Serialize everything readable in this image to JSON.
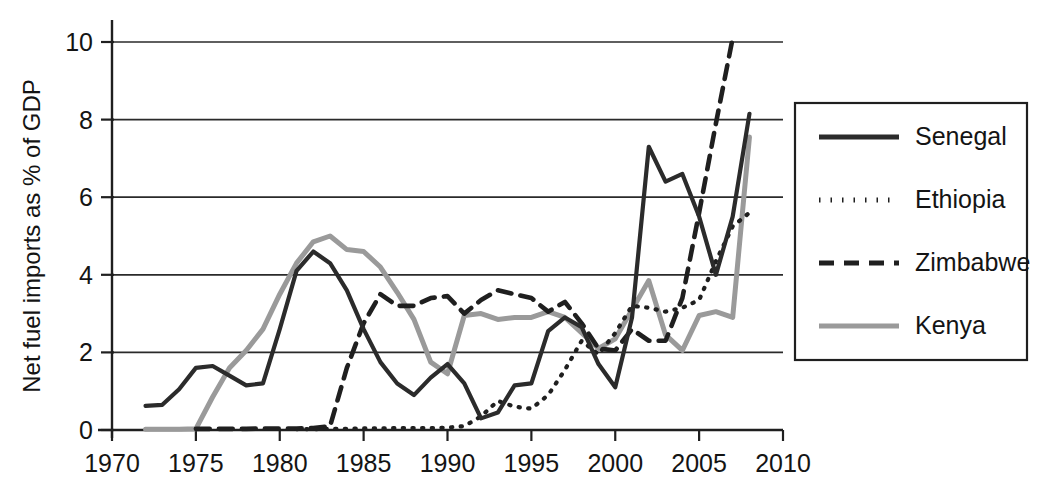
{
  "chart_data": {
    "type": "line",
    "title": "",
    "subtitle": "",
    "xlabel": "",
    "ylabel": "Net fuel imports as % of GDP",
    "xlim": [
      1970,
      2010
    ],
    "ylim": [
      0,
      10
    ],
    "grid": true,
    "grid_axis": "y",
    "legend_position": "right",
    "x_ticks": [
      "1970",
      "1975",
      "1980",
      "1985",
      "1990",
      "1995",
      "2000",
      "2005",
      "2010"
    ],
    "x_tick_values": [
      1970,
      1975,
      1980,
      1985,
      1990,
      1995,
      2000,
      2005,
      2010
    ],
    "y_ticks": [
      "0",
      "2",
      "4",
      "6",
      "8",
      "10"
    ],
    "y_tick_values": [
      0,
      2,
      4,
      6,
      8,
      10
    ],
    "series": [
      {
        "name": "Senegal",
        "style": "solid",
        "color": "#2b2b2b",
        "width": 4.2,
        "x": [
          1972,
          1973,
          1974,
          1975,
          1976,
          1977,
          1978,
          1979,
          1980,
          1981,
          1982,
          1983,
          1984,
          1985,
          1986,
          1987,
          1988,
          1989,
          1990,
          1991,
          1992,
          1993,
          1994,
          1995,
          1996,
          1997,
          1998,
          1999,
          2000,
          2001,
          2002,
          2003,
          2004,
          2005,
          2006,
          2007,
          2008
        ],
        "values": [
          0.62,
          0.65,
          1.05,
          1.6,
          1.65,
          1.4,
          1.15,
          1.2,
          2.6,
          4.1,
          4.6,
          4.3,
          3.6,
          2.6,
          1.75,
          1.2,
          0.9,
          1.35,
          1.7,
          1.2,
          0.3,
          0.45,
          1.15,
          1.2,
          2.55,
          2.9,
          2.65,
          1.7,
          1.1,
          2.9,
          7.3,
          6.4,
          6.6,
          5.5,
          4.0,
          5.5,
          8.15
        ]
      },
      {
        "name": "Ethiopia",
        "style": "dotted",
        "color": "#1f1f1f",
        "width": 4.2,
        "x": [
          1981,
          1982,
          1983,
          1984,
          1985,
          1986,
          1987,
          1988,
          1989,
          1990,
          1991,
          1992,
          1993,
          1994,
          1995,
          1996,
          1997,
          1998,
          1999,
          2000,
          2001,
          2002,
          2003,
          2004,
          2005,
          2006,
          2007,
          2008
        ],
        "values": [
          0.02,
          0.02,
          0.03,
          0.03,
          0.04,
          0.04,
          0.05,
          0.05,
          0.05,
          0.06,
          0.1,
          0.35,
          0.75,
          0.6,
          0.55,
          0.9,
          1.55,
          2.3,
          1.95,
          2.5,
          3.2,
          3.15,
          3.05,
          3.15,
          3.35,
          4.35,
          5.25,
          5.6
        ]
      },
      {
        "name": "Zimbabwe",
        "style": "dashed",
        "color": "#1f1f1f",
        "width": 4.6,
        "x": [
          1975,
          1976,
          1977,
          1978,
          1979,
          1980,
          1981,
          1982,
          1983,
          1984,
          1985,
          1986,
          1987,
          1988,
          1989,
          1990,
          1991,
          1992,
          1993,
          1994,
          1995,
          1996,
          1997,
          1998,
          1999,
          2000,
          2001,
          2002,
          2003,
          2004,
          2005,
          2006,
          2007
        ],
        "values": [
          0.03,
          0.03,
          0.03,
          0.03,
          0.04,
          0.04,
          0.04,
          0.05,
          0.1,
          1.6,
          2.75,
          3.5,
          3.2,
          3.2,
          3.4,
          3.45,
          3.0,
          3.35,
          3.6,
          3.5,
          3.4,
          3.05,
          3.3,
          2.75,
          2.1,
          2.05,
          2.6,
          2.3,
          2.3,
          3.4,
          5.6,
          7.9,
          10.1
        ]
      },
      {
        "name": "Kenya",
        "style": "solid",
        "color": "#9a9a9a",
        "width": 5.0,
        "x": [
          1972,
          1973,
          1974,
          1975,
          1976,
          1977,
          1978,
          1979,
          1980,
          1981,
          1982,
          1983,
          1984,
          1985,
          1986,
          1987,
          1988,
          1989,
          1990,
          1991,
          1992,
          1993,
          1994,
          1995,
          1996,
          1997,
          1998,
          1999,
          2000,
          2001,
          2002,
          2003,
          2004,
          2005,
          2006,
          2007,
          2008
        ],
        "values": [
          0.02,
          0.02,
          0.02,
          0.03,
          0.85,
          1.6,
          2.05,
          2.6,
          3.5,
          4.3,
          4.85,
          5.0,
          4.65,
          4.6,
          4.2,
          3.55,
          2.85,
          1.75,
          1.45,
          2.95,
          3.0,
          2.85,
          2.9,
          2.9,
          3.05,
          2.9,
          2.5,
          2.1,
          2.35,
          3.1,
          3.85,
          2.45,
          2.05,
          2.95,
          3.05,
          2.9,
          7.55
        ]
      }
    ]
  },
  "axes": {
    "y_axis_title": "Net fuel imports as % of GDP",
    "y_tick_labels": [
      "0",
      "2",
      "4",
      "6",
      "8",
      "10"
    ],
    "x_tick_labels": [
      "1970",
      "1975",
      "1980",
      "1985",
      "1990",
      "1995",
      "2000",
      "2005",
      "2010"
    ]
  },
  "legend": {
    "entries": [
      {
        "label": "Senegal",
        "style": "solid",
        "color": "#2b2b2b"
      },
      {
        "label": "Ethiopia",
        "style": "dotted",
        "color": "#1f1f1f"
      },
      {
        "label": "Zimbabwe",
        "style": "dashed",
        "color": "#1f1f1f"
      },
      {
        "label": "Kenya",
        "style": "solid",
        "color": "#9a9a9a"
      }
    ]
  },
  "colors": {
    "senegal": "#2b2b2b",
    "ethiopia": "#1f1f1f",
    "zimbabwe": "#1f1f1f",
    "kenya": "#9a9a9a",
    "axis": "#1f1f1f",
    "background": "#ffffff"
  }
}
